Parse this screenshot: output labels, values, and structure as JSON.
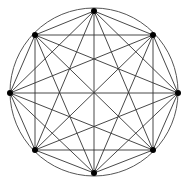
{
  "diagram": {
    "type": "complete-graph",
    "name": "K8",
    "circle": {
      "cx": 94,
      "cy": 92,
      "r": 84,
      "stroke": "#555555"
    },
    "edge_color": "#333333",
    "node_color": "#000000",
    "node_radius": 3,
    "nodes": [
      {
        "id": "n0",
        "x": 94,
        "y": 11
      },
      {
        "id": "n1",
        "x": 153,
        "y": 35
      },
      {
        "id": "n2",
        "x": 178,
        "y": 93
      },
      {
        "id": "n3",
        "x": 153,
        "y": 150
      },
      {
        "id": "n4",
        "x": 94,
        "y": 173
      },
      {
        "id": "n5",
        "x": 35,
        "y": 150
      },
      {
        "id": "n6",
        "x": 10,
        "y": 93
      },
      {
        "id": "n7",
        "x": 35,
        "y": 35
      }
    ]
  }
}
